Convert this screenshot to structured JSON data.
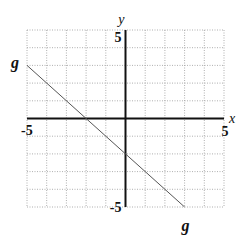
{
  "chart_data": {
    "type": "line",
    "title": "",
    "xlabel": "x",
    "ylabel": "y",
    "xlim": [
      -5,
      5
    ],
    "ylim": [
      -5,
      5
    ],
    "grid": true,
    "grid_style": "dotted",
    "tick_labels": {
      "x_min": "-5",
      "x_max": "5",
      "y_min": "-5",
      "y_max": "5"
    },
    "series": [
      {
        "name": "g",
        "equation": "y = -x - 2",
        "points": [
          [
            -5,
            3
          ],
          [
            3,
            -5
          ]
        ],
        "labels": [
          "g",
          "g"
        ]
      }
    ],
    "colors": {
      "grid": "#9a9a9a",
      "axes": "#111111",
      "line": "#555555"
    }
  }
}
